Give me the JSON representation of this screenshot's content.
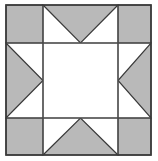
{
  "figure": {
    "kind": "quilt-block-diagram",
    "width": 158,
    "height": 161
  },
  "colors": {
    "background": "#ffffff",
    "patch_fill_light": "#ffffff",
    "patch_fill_shaded": "#b9b9b9",
    "outline": "#3a3a3a",
    "grid_line": "#4a4a4a"
  },
  "geometry": {
    "block_left": 6,
    "block_top": 5,
    "block_right": 151,
    "block_bottom": 155,
    "grid_x1": 43,
    "grid_x2": 118,
    "grid_y1": 43,
    "grid_y2": 118,
    "outer_stroke_width": 1.6,
    "grid_stroke_width": 1.2,
    "patch_stroke_width": 1.2
  },
  "block": {
    "name": "sawtooth-star",
    "rows": 3,
    "cols": 3,
    "cells": [
      {
        "id": "corner-top-left",
        "position": "top-left",
        "shape": "square",
        "fill": "shaded"
      },
      {
        "id": "edge-top-center",
        "position": "top-center",
        "shape": "triangle",
        "fill": "shaded",
        "points_toward": "center",
        "apex": "down"
      },
      {
        "id": "corner-top-right",
        "position": "top-right",
        "shape": "square",
        "fill": "shaded"
      },
      {
        "id": "edge-middle-left",
        "position": "middle-left",
        "shape": "triangle",
        "fill": "shaded",
        "points_toward": "center",
        "apex": "right"
      },
      {
        "id": "center-square",
        "position": "center",
        "shape": "square",
        "fill": "light"
      },
      {
        "id": "edge-middle-right",
        "position": "middle-right",
        "shape": "triangle",
        "fill": "shaded",
        "points_toward": "center",
        "apex": "left"
      },
      {
        "id": "corner-bottom-left",
        "position": "bottom-left",
        "shape": "square",
        "fill": "shaded"
      },
      {
        "id": "edge-bottom-center",
        "position": "bottom-center",
        "shape": "triangle",
        "fill": "shaded",
        "points_toward": "center",
        "apex": "up"
      },
      {
        "id": "corner-bottom-right",
        "position": "bottom-right",
        "shape": "square",
        "fill": "shaded"
      }
    ]
  }
}
